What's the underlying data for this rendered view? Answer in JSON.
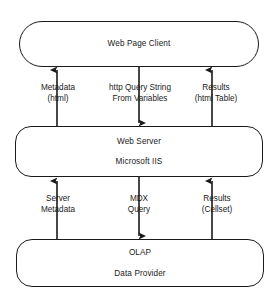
{
  "diagram": {
    "stroke_color": "#1a1a1a",
    "background_color": "#ffffff",
    "nodes": [
      {
        "id": "client",
        "lines": [
          "Web Page Client"
        ]
      },
      {
        "id": "server",
        "lines": [
          "Web Server",
          "Microsoft IIS"
        ]
      },
      {
        "id": "olap",
        "lines": [
          "OLAP",
          "Data Provider"
        ]
      }
    ],
    "connectors": [
      {
        "id": "metadata",
        "lines": [
          "Metadata",
          "(html)"
        ],
        "direction": "up",
        "from": "server",
        "to": "client"
      },
      {
        "id": "http_query",
        "lines": [
          "http Query String",
          "From Variables"
        ],
        "direction": "down",
        "from": "client",
        "to": "server"
      },
      {
        "id": "results_html",
        "lines": [
          "Results",
          "(html Table)"
        ],
        "direction": "up",
        "from": "server",
        "to": "client"
      },
      {
        "id": "server_metadata",
        "lines": [
          "Server",
          "Metadata"
        ],
        "direction": "up",
        "from": "olap",
        "to": "server"
      },
      {
        "id": "mdx_query",
        "lines": [
          "MDX",
          "Query"
        ],
        "direction": "down",
        "from": "server",
        "to": "olap"
      },
      {
        "id": "results_cellset",
        "lines": [
          "Results",
          "(Cellset)"
        ],
        "direction": "up",
        "from": "olap",
        "to": "server"
      }
    ]
  }
}
